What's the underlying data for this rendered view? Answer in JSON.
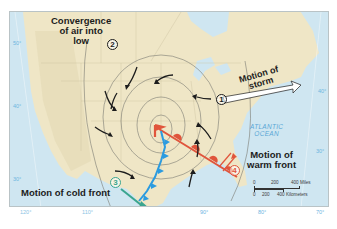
{
  "map": {
    "type": "weather map",
    "region": "North America (United States)",
    "labels": {
      "convergence": [
        "Convergence",
        "of air into",
        "low"
      ],
      "storm_motion": [
        "Motion of",
        "storm"
      ],
      "warm_front_motion": [
        "Motion of",
        "warm front"
      ],
      "cold_front_motion": "Motion of cold front",
      "ocean": [
        "ATLANTIC",
        "OCEAN"
      ]
    },
    "callouts": [
      {
        "number": "1",
        "meaning": "Motion of storm",
        "color": "#1c1c1c"
      },
      {
        "number": "2",
        "meaning": "Convergence of air into low",
        "color": "#1c1c1c"
      },
      {
        "number": "3",
        "meaning": "Motion of cold front",
        "color": "#3aa58f"
      },
      {
        "number": "4",
        "meaning": "Motion of warm front",
        "color": "#e0553c"
      }
    ],
    "latitude_labels_left": [
      "50°",
      "40°",
      "30°"
    ],
    "latitude_labels_right": [
      "40°",
      "30°"
    ],
    "longitude_labels_bottom": [
      "120°",
      "110°",
      "90°",
      "80°",
      "70°"
    ],
    "scale_bar": {
      "miles": [
        "0",
        "200",
        "400 Miles"
      ],
      "kilometers": [
        "0",
        "200",
        "400 Kilometers"
      ]
    },
    "colors": {
      "land": "#efe6c6",
      "water": "#cfe6f1",
      "cold_front": "#2b9be0",
      "warm_front": "#e0553c",
      "isobar": "#7a7a72",
      "arrow": "#1c1c1c"
    }
  }
}
